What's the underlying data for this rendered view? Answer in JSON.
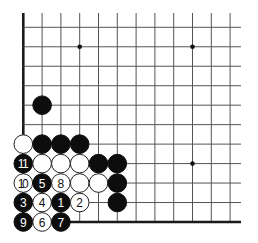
{
  "board": {
    "view": "lower-left corner",
    "origin_x": 23.3,
    "origin_y": 27.3,
    "spacing_x": 18.8,
    "spacing_y": 19.47,
    "cols": 12,
    "rows": 11,
    "vline_top": 13,
    "hline_right": 241,
    "left_edge": true,
    "bottom_edge": true,
    "stone_radius": 9.3,
    "colors": {
      "black": "#0d0d0d",
      "white": "#ffffff",
      "line": "#555555"
    }
  },
  "star_points": [
    {
      "col": 3,
      "row": 1
    },
    {
      "col": 9,
      "row": 1
    },
    {
      "col": 9,
      "row": 7
    }
  ],
  "stones": [
    {
      "col": 1,
      "row": 4,
      "color": "black",
      "label": ""
    },
    {
      "col": 0,
      "row": 6,
      "color": "white",
      "label": ""
    },
    {
      "col": 1,
      "row": 6,
      "color": "black",
      "label": ""
    },
    {
      "col": 2,
      "row": 6,
      "color": "black",
      "label": ""
    },
    {
      "col": 3,
      "row": 6,
      "color": "black",
      "label": ""
    },
    {
      "col": 0,
      "row": 7,
      "color": "black",
      "label": "11"
    },
    {
      "col": 1,
      "row": 7,
      "color": "white",
      "label": ""
    },
    {
      "col": 2,
      "row": 7,
      "color": "white",
      "label": ""
    },
    {
      "col": 3,
      "row": 7,
      "color": "white",
      "label": ""
    },
    {
      "col": 4,
      "row": 7,
      "color": "black",
      "label": ""
    },
    {
      "col": 5,
      "row": 7,
      "color": "black",
      "label": ""
    },
    {
      "col": 0,
      "row": 8,
      "color": "white",
      "label": "10"
    },
    {
      "col": 1,
      "row": 8,
      "color": "black",
      "label": "5"
    },
    {
      "col": 2,
      "row": 8,
      "color": "white",
      "label": "8"
    },
    {
      "col": 3,
      "row": 8,
      "color": "white",
      "label": ""
    },
    {
      "col": 4,
      "row": 8,
      "color": "white",
      "label": ""
    },
    {
      "col": 5,
      "row": 8,
      "color": "black",
      "label": ""
    },
    {
      "col": 0,
      "row": 9,
      "color": "black",
      "label": "3"
    },
    {
      "col": 1,
      "row": 9,
      "color": "white",
      "label": "4"
    },
    {
      "col": 2,
      "row": 9,
      "color": "black",
      "label": "1"
    },
    {
      "col": 3,
      "row": 9,
      "color": "white",
      "label": "2"
    },
    {
      "col": 5,
      "row": 9,
      "color": "black",
      "label": ""
    },
    {
      "col": 0,
      "row": 10,
      "color": "black",
      "label": "9"
    },
    {
      "col": 1,
      "row": 10,
      "color": "white",
      "label": "6"
    },
    {
      "col": 2,
      "row": 10,
      "color": "black",
      "label": "7"
    }
  ]
}
